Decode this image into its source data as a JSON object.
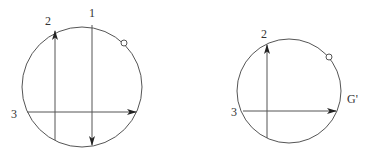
{
  "colors": {
    "stroke": "#555555",
    "arrow": "#222222",
    "text": "#333333",
    "background": "#ffffff"
  },
  "left_figure": {
    "circle": {
      "cx": 82,
      "cy": 87,
      "r": 60
    },
    "marker": {
      "cx": 124,
      "cy": 43,
      "r": 3
    },
    "lines": [
      {
        "id": "1",
        "label": "1",
        "x1": 92,
        "y1": 25,
        "x2": 92,
        "y2": 145,
        "direction": "down",
        "label_x": 89,
        "label_y": 17
      },
      {
        "id": "2",
        "label": "2",
        "x1": 55,
        "y1": 140,
        "x2": 55,
        "y2": 31,
        "direction": "up",
        "label_x": 45,
        "label_y": 25
      },
      {
        "id": "3",
        "label": "3",
        "x1": 27,
        "y1": 112,
        "x2": 136,
        "y2": 112,
        "direction": "right",
        "label_x": 11,
        "label_y": 118
      }
    ]
  },
  "right_figure": {
    "circle": {
      "cx": 289,
      "cy": 91,
      "r": 52
    },
    "marker": {
      "cx": 329,
      "cy": 57,
      "r": 3
    },
    "lines": [
      {
        "id": "2",
        "label": "2",
        "x1": 267,
        "y1": 138,
        "x2": 267,
        "y2": 45,
        "direction": "up",
        "label_x": 261,
        "label_y": 38
      },
      {
        "id": "3",
        "label": "3",
        "x1": 243,
        "y1": 111,
        "x2": 336,
        "y2": 111,
        "direction": "right",
        "label_x": 231,
        "label_y": 116
      }
    ],
    "side_label": {
      "text": "G'",
      "x": 347,
      "y": 103
    }
  }
}
